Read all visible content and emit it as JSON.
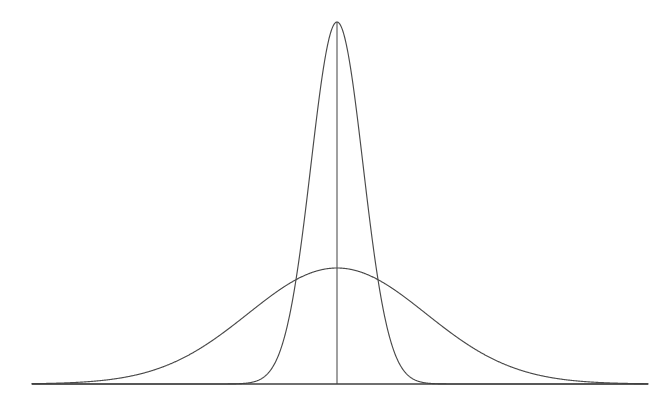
{
  "figure": {
    "title": "",
    "background_color": "#ffffff",
    "line_color": "#4a4a4a",
    "axis_color": "#3f3f3f",
    "width": 667,
    "height": 401
  },
  "chart_data": {
    "type": "line",
    "title": "",
    "subtitle": "",
    "xlabel": "",
    "ylabel": "",
    "grid": false,
    "legend": null,
    "legend_position": "none",
    "axes": {
      "x_axis_visible": true,
      "y_axis_visible": false,
      "x_tick_labels": [],
      "y_tick_labels": [],
      "xlim": [
        -3.5,
        3.5
      ],
      "ylim": [
        0,
        1.0
      ]
    },
    "annotations": [
      {
        "name": "mean-vertical-line",
        "type": "vertical-line",
        "x": 0,
        "from_y": 0,
        "to_y": 1.0
      }
    ],
    "geometry": {
      "baseline_y_px": 384,
      "baseline_x_start_px": 32,
      "baseline_x_end_px": 648,
      "center_x_px": 337
    },
    "series": [
      {
        "name": "narrow-tall-normal",
        "mean": 0,
        "sigma": 0.295,
        "peak_height": 1.0,
        "peak_x_px": 337,
        "peak_y_px": 22,
        "sigma_px": 26,
        "stroke": "#4a4a4a",
        "x": [
          -3.5,
          -3.0,
          -2.5,
          -2.0,
          -1.5,
          -1.2,
          -1.0,
          -0.9,
          -0.8,
          -0.7,
          -0.6,
          -0.5,
          -0.4,
          -0.3,
          -0.2,
          -0.1,
          0.0,
          0.1,
          0.2,
          0.3,
          0.4,
          0.5,
          0.6,
          0.7,
          0.8,
          0.9,
          1.0,
          1.2,
          1.5,
          2.0,
          2.5,
          3.0,
          3.5
        ],
        "y": [
          0.0,
          0.0,
          0.0,
          0.0,
          0.0,
          0.001,
          0.003,
          0.008,
          0.026,
          0.06,
          0.13,
          0.24,
          0.4,
          0.59,
          0.79,
          0.94,
          1.0,
          0.94,
          0.79,
          0.59,
          0.4,
          0.24,
          0.13,
          0.06,
          0.026,
          0.008,
          0.003,
          0.001,
          0.0,
          0.0,
          0.0,
          0.0,
          0.0
        ]
      },
      {
        "name": "broad-flat-normal",
        "mean": 0,
        "sigma": 1.0,
        "peak_height": 0.32,
        "peak_x_px": 337,
        "peak_y_px": 268,
        "sigma_px": 89,
        "stroke": "#4a4a4a",
        "x": [
          -3.5,
          -3.0,
          -2.5,
          -2.0,
          -1.75,
          -1.5,
          -1.25,
          -1.0,
          -0.75,
          -0.5,
          -0.25,
          0.0,
          0.25,
          0.5,
          0.75,
          1.0,
          1.25,
          1.5,
          1.75,
          2.0,
          2.5,
          3.0,
          3.5
        ],
        "y": [
          0.0007,
          0.0035,
          0.0113,
          0.0289,
          0.0455,
          0.0675,
          0.0944,
          0.1244,
          0.1551,
          0.1827,
          0.2034,
          0.211,
          0.2034,
          0.1827,
          0.1551,
          0.1244,
          0.0944,
          0.0675,
          0.0455,
          0.0289,
          0.0113,
          0.0035,
          0.0007
        ]
      }
    ]
  }
}
